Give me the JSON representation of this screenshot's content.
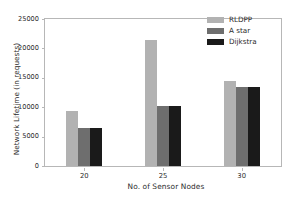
{
  "chart_data": {
    "type": "bar",
    "title": "",
    "xlabel": "No. of Sensor Nodes",
    "ylabel": "Network Lifetime (in requests)",
    "categories": [
      "20",
      "25",
      "30"
    ],
    "series": [
      {
        "name": "RLDPP",
        "color": "#b2b2b2",
        "values": [
          9400,
          21450,
          14450
        ]
      },
      {
        "name": "A star",
        "color": "#6e6e6e",
        "values": [
          6550,
          10250,
          13400
        ]
      },
      {
        "name": "Dijkstra",
        "color": "#1a1a1a",
        "values": [
          6550,
          10280,
          13420
        ]
      }
    ],
    "ylim": [
      0,
      25000
    ],
    "yticks": [
      "0",
      "5000",
      "10000",
      "15000",
      "20000",
      "25000"
    ],
    "ytick_values": [
      0,
      5000,
      10000,
      15000,
      20000,
      25000
    ],
    "grid": false,
    "legend_position": "top-right",
    "axis_color": "#b7b7b7",
    "background": "#ffffff"
  }
}
